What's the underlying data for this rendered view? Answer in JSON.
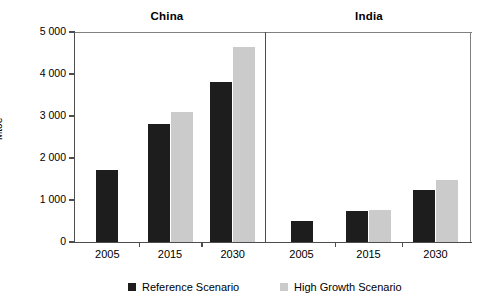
{
  "chart_data": {
    "type": "bar",
    "title": "",
    "xlabel": "",
    "ylabel": "Mtoe",
    "ylim": [
      0,
      5000
    ],
    "ytick_values": [
      5000,
      4000,
      3000,
      2000,
      1000,
      0
    ],
    "ytick_labels": [
      "5 000",
      "4 000",
      "3 000",
      "2 000",
      "1 000",
      "0"
    ],
    "grid": false,
    "legend_position": "bottom",
    "panels": [
      {
        "name": "China",
        "categories": [
          "2005",
          "2015",
          "2030"
        ],
        "series": [
          {
            "name": "Reference Scenario",
            "color": "#1d1d1d",
            "values": [
              1720,
              2810,
              3800
            ]
          },
          {
            "name": "High Growth Scenario",
            "color": "#cbcbcb",
            "values": [
              null,
              3100,
              4650
            ]
          }
        ]
      },
      {
        "name": "India",
        "categories": [
          "2005",
          "2015",
          "2030"
        ],
        "series": [
          {
            "name": "Reference Scenario",
            "color": "#1d1d1d",
            "values": [
              500,
              730,
              1250
            ]
          },
          {
            "name": "High Growth Scenario",
            "color": "#cbcbcb",
            "values": [
              null,
              760,
              1470
            ]
          }
        ]
      }
    ],
    "legend": [
      {
        "label": "Reference Scenario",
        "color": "#1d1d1d"
      },
      {
        "label": "High Growth Scenario",
        "color": "#cbcbcb"
      }
    ]
  },
  "colors": {
    "reference": "#1d1d1d",
    "high_growth": "#cbcbcb",
    "axis": "#4d4d4d",
    "frame": "#808080",
    "background": "#ffffff"
  }
}
